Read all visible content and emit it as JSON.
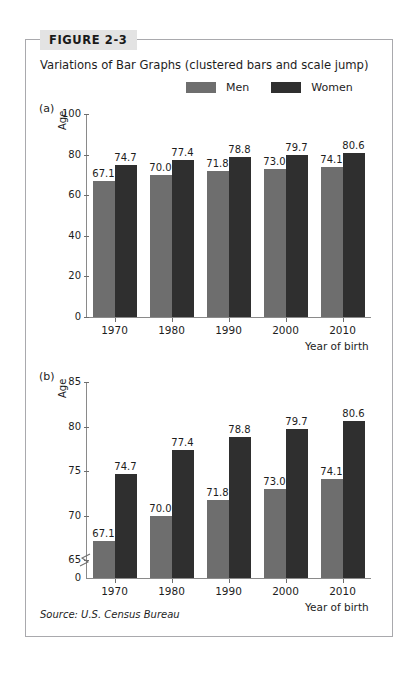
{
  "figure": {
    "number_label": "FIGURE 2-3",
    "title": "Variations of Bar Graphs (clustered bars and scale jump)",
    "source_note": "Source: U.S. Census Bureau"
  },
  "legend": {
    "entries": [
      {
        "label": "Men",
        "color": "#6e6e6e",
        "swatch_icon": "legend-swatch-men"
      },
      {
        "label": "Women",
        "color": "#2f2f2f",
        "swatch_icon": "legend-swatch-women"
      }
    ]
  },
  "panels": [
    {
      "key": "a",
      "label": "(a)",
      "axis_title": "Age"
    },
    {
      "key": "b",
      "label": "(b)",
      "axis_title": "Age"
    }
  ],
  "chart_data": [
    {
      "type": "bar",
      "panel": "a",
      "title": "Variations of Bar Graphs (clustered bars and scale jump)",
      "xlabel": "Year of birth",
      "ylabel": "Age",
      "categories": [
        "1970",
        "1980",
        "1990",
        "2000",
        "2010"
      ],
      "series": [
        {
          "name": "Men",
          "color": "#6e6e6e",
          "values": [
            67.1,
            70.0,
            71.8,
            73.0,
            74.1
          ]
        },
        {
          "name": "Women",
          "color": "#2f2f2f",
          "values": [
            74.7,
            77.4,
            78.8,
            79.7,
            80.6
          ]
        }
      ],
      "value_labels": {
        "Men": [
          "67.1",
          "70.0",
          "71.8",
          "73.0",
          "74.1"
        ],
        "Women": [
          "74.7",
          "77.4",
          "78.8",
          "79.7",
          "80.6"
        ]
      },
      "ylim": [
        0,
        100
      ],
      "yticks": [
        0,
        20,
        40,
        60,
        80,
        100
      ],
      "ytick_labels": [
        "0",
        "20",
        "40",
        "60",
        "80",
        "100"
      ],
      "grid": false,
      "scale_break": false,
      "legend_position": "top"
    },
    {
      "type": "bar",
      "panel": "b",
      "xlabel": "Year of birth",
      "ylabel": "Age",
      "categories": [
        "1970",
        "1980",
        "1990",
        "2000",
        "2010"
      ],
      "series": [
        {
          "name": "Men",
          "color": "#6e6e6e",
          "values": [
            67.1,
            70.0,
            71.8,
            73.0,
            74.1
          ]
        },
        {
          "name": "Women",
          "color": "#2f2f2f",
          "values": [
            74.7,
            77.4,
            78.8,
            79.7,
            80.6
          ]
        }
      ],
      "value_labels": {
        "Men": [
          "67.1",
          "70.0",
          "71.8",
          "73.0",
          "74.1"
        ],
        "Women": [
          "74.7",
          "77.4",
          "78.8",
          "79.7",
          "80.6"
        ]
      },
      "ylim": [
        63,
        85
      ],
      "yticks": [
        0,
        65,
        70,
        75,
        80,
        85
      ],
      "ytick_labels": [
        "0",
        "65",
        "70",
        "75",
        "80",
        "85"
      ],
      "grid": false,
      "scale_break": true,
      "scale_break_icon": "axis-scale-break-icon",
      "legend_position": "top"
    }
  ]
}
